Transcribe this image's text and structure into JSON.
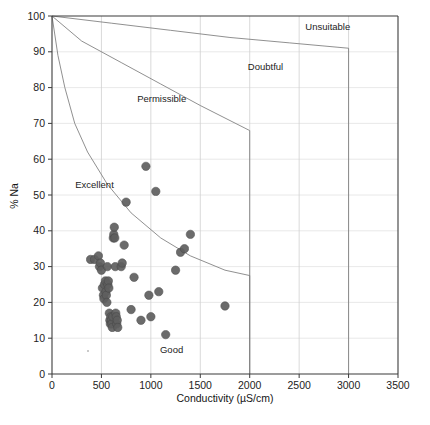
{
  "figure": {
    "name": "wilcox-sodium-conductivity-diagram",
    "caption_ghost": ""
  },
  "chart_data": {
    "type": "scatter",
    "title": "",
    "xlabel": "Conductivity (µS/cm)",
    "ylabel": "% Na",
    "xlim": [
      0,
      3500
    ],
    "ylim": [
      0,
      100
    ],
    "xticks": [
      0,
      500,
      1000,
      1500,
      2000,
      2500,
      3000,
      3500
    ],
    "yticks": [
      0,
      10,
      20,
      30,
      40,
      50,
      60,
      70,
      80,
      90,
      100
    ],
    "grid": true,
    "legend": "none",
    "marker_color": "#5f5f5f",
    "boundary_color": "#7c7c7c",
    "annotations": [
      {
        "text": "Excellent",
        "x": 430,
        "y": 52
      },
      {
        "text": "Permissible",
        "x": 1110,
        "y": 76
      },
      {
        "text": "Doubtful",
        "x": 2160,
        "y": 85
      },
      {
        "text": "Unsuitable",
        "x": 2790,
        "y": 96
      },
      {
        "text": "Good",
        "x": 1210,
        "y": 6
      }
    ],
    "boundaries": [
      {
        "name": "excellent-good",
        "points": [
          [
            0,
            100
          ],
          [
            60,
            89
          ],
          [
            130,
            80
          ],
          [
            230,
            70
          ],
          [
            360,
            62
          ],
          [
            560,
            53
          ],
          [
            800,
            45
          ],
          [
            1100,
            38
          ],
          [
            1400,
            33
          ],
          [
            1750,
            29
          ],
          [
            2000,
            27.5
          ],
          [
            2000,
            0
          ]
        ]
      },
      {
        "name": "good-permissible",
        "points": [
          [
            0,
            100
          ],
          [
            300,
            93
          ],
          [
            700,
            87
          ],
          [
            1100,
            81
          ],
          [
            1500,
            75
          ],
          [
            2000,
            68
          ],
          [
            2000,
            0
          ]
        ]
      },
      {
        "name": "permissible-doubtful",
        "points": [
          [
            0,
            100
          ],
          [
            600,
            98
          ],
          [
            1200,
            96
          ],
          [
            1800,
            94
          ],
          [
            2400,
            92.5
          ],
          [
            3000,
            91
          ],
          [
            3000,
            0
          ]
        ]
      }
    ],
    "points": [
      [
        390,
        32
      ],
      [
        430,
        32
      ],
      [
        470,
        33
      ],
      [
        480,
        30
      ],
      [
        490,
        31
      ],
      [
        500,
        29
      ],
      [
        510,
        24
      ],
      [
        520,
        22
      ],
      [
        525,
        21
      ],
      [
        530,
        25
      ],
      [
        540,
        26
      ],
      [
        545,
        23
      ],
      [
        550,
        22
      ],
      [
        555,
        20
      ],
      [
        560,
        30
      ],
      [
        565,
        25
      ],
      [
        570,
        26
      ],
      [
        575,
        24
      ],
      [
        580,
        17
      ],
      [
        585,
        15
      ],
      [
        590,
        14
      ],
      [
        595,
        16
      ],
      [
        600,
        15
      ],
      [
        605,
        14
      ],
      [
        610,
        13
      ],
      [
        615,
        16
      ],
      [
        620,
        38
      ],
      [
        625,
        39
      ],
      [
        630,
        41
      ],
      [
        635,
        38
      ],
      [
        640,
        30
      ],
      [
        645,
        17
      ],
      [
        650,
        16
      ],
      [
        655,
        14
      ],
      [
        660,
        15
      ],
      [
        665,
        13
      ],
      [
        700,
        30
      ],
      [
        710,
        31
      ],
      [
        730,
        36
      ],
      [
        750,
        48
      ],
      [
        800,
        18
      ],
      [
        830,
        27
      ],
      [
        900,
        15
      ],
      [
        950,
        58
      ],
      [
        980,
        22
      ],
      [
        1000,
        16
      ],
      [
        1050,
        51
      ],
      [
        1080,
        23
      ],
      [
        1150,
        11
      ],
      [
        1250,
        29
      ],
      [
        1300,
        34
      ],
      [
        1340,
        35
      ],
      [
        1400,
        39
      ],
      [
        1750,
        19
      ]
    ]
  }
}
